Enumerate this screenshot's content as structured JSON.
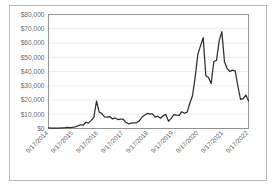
{
  "chart_data": {
    "type": "line",
    "title": "",
    "xlabel": "",
    "ylabel": "",
    "ylim": [
      0,
      80000
    ],
    "grid": true,
    "legend": "none",
    "y_ticks": [
      0,
      10000,
      20000,
      30000,
      40000,
      50000,
      60000,
      70000,
      80000
    ],
    "y_tick_labels": [
      "$0",
      "$10,000",
      "$20,000",
      "$30,000",
      "$40,000",
      "$50,000",
      "$60,000",
      "$70,000",
      "$80,000"
    ],
    "x_tick_labels": [
      "9/17/2014",
      "9/17/2015",
      "9/17/2016",
      "9/17/2017",
      "9/17/2018",
      "9/17/2019",
      "9/17/2020",
      "9/17/2021",
      "9/17/2022"
    ],
    "x_range": [
      "9/17/2014",
      "9/17/2022"
    ],
    "series": [
      {
        "name": "Price",
        "color": "#2f2f2f",
        "x": [
          "9/17/2014",
          "12/17/2014",
          "3/17/2015",
          "6/17/2015",
          "9/17/2015",
          "12/17/2015",
          "3/17/2016",
          "6/17/2016",
          "9/17/2016",
          "12/17/2016",
          "3/17/2017",
          "5/17/2017",
          "6/17/2017",
          "7/17/2017",
          "8/17/2017",
          "9/17/2017",
          "10/17/2017",
          "11/17/2017",
          "12/17/2017",
          "1/17/2018",
          "2/17/2018",
          "3/17/2018",
          "4/17/2018",
          "5/17/2018",
          "6/17/2018",
          "7/17/2018",
          "8/17/2018",
          "9/17/2018",
          "10/17/2018",
          "11/17/2018",
          "12/17/2018",
          "1/17/2019",
          "2/17/2019",
          "3/17/2019",
          "4/17/2019",
          "5/17/2019",
          "6/17/2019",
          "7/17/2019",
          "8/17/2019",
          "9/17/2019",
          "10/17/2019",
          "11/17/2019",
          "12/17/2019",
          "1/17/2020",
          "2/17/2020",
          "3/17/2020",
          "4/17/2020",
          "5/17/2020",
          "6/17/2020",
          "7/17/2020",
          "8/17/2020",
          "9/17/2020",
          "10/17/2020",
          "11/17/2020",
          "12/17/2020",
          "1/17/2021",
          "2/17/2021",
          "3/17/2021",
          "4/14/2021",
          "5/17/2021",
          "6/17/2021",
          "7/17/2021",
          "8/17/2021",
          "9/17/2021",
          "10/17/2021",
          "11/10/2021",
          "12/17/2021",
          "1/17/2022",
          "2/17/2022",
          "3/17/2022",
          "4/17/2022",
          "5/17/2022",
          "6/17/2022",
          "7/17/2022",
          "8/17/2022",
          "9/17/2022"
        ],
        "values": [
          450,
          330,
          290,
          250,
          230,
          440,
          415,
          760,
          610,
          790,
          1180,
          1800,
          2600,
          2300,
          4400,
          3800,
          5700,
          7800,
          19300,
          11500,
          10500,
          8200,
          8000,
          8400,
          6700,
          7400,
          6300,
          6500,
          6500,
          4300,
          3300,
          3700,
          3900,
          4000,
          5200,
          7900,
          9300,
          10600,
          10200,
          10200,
          8000,
          8600,
          7200,
          8900,
          9900,
          5100,
          7100,
          9700,
          9400,
          9200,
          11800,
          10700,
          11500,
          17700,
          23000,
          36000,
          52000,
          58000,
          63800,
          37000,
          35800,
          31500,
          47000,
          47800,
          61500,
          68000,
          46800,
          42000,
          40000,
          41000,
          40500,
          30000,
          20500,
          21000,
          23500,
          19400
        ]
      }
    ]
  }
}
